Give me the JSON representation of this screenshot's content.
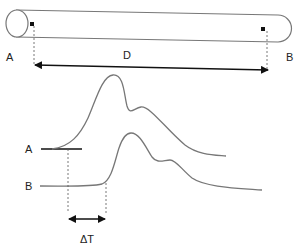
{
  "diagram": {
    "pipe": {
      "label_start": "A",
      "label_end": "B",
      "distance_label": "D"
    },
    "signals": {
      "curve_a_label": "A",
      "curve_b_label": "B",
      "delay_label": "ΔT"
    },
    "colors": {
      "stroke": "#777777",
      "arrow": "#111111",
      "text": "#222222"
    }
  }
}
